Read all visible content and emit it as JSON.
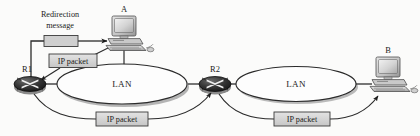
{
  "figure": {
    "kind": "network-diagram",
    "topic": "ICMP redirection",
    "background_color": "#fbfbfa",
    "ink_color": "#1b1b1b"
  },
  "hosts": [
    {
      "id": "A",
      "label": "A",
      "icon": "desktop-computer-icon"
    },
    {
      "id": "B",
      "label": "B",
      "icon": "desktop-computer-icon"
    }
  ],
  "routers": [
    {
      "id": "R1",
      "label": "R1",
      "icon": "router-icon"
    },
    {
      "id": "R2",
      "label": "R2",
      "icon": "router-icon"
    }
  ],
  "networks": [
    {
      "id": "lan-left",
      "label": "LAN",
      "shape": "ellipse"
    },
    {
      "id": "lan-right",
      "label": "LAN",
      "shape": "ellipse"
    }
  ],
  "messages": {
    "redirection": {
      "caption_line1": "Redirection",
      "caption_line2": "message",
      "box_label": "",
      "fill": "#cfcfcf"
    },
    "packets": [
      {
        "id": "ip-packet-a-to-r1",
        "label": "IP packet",
        "fill": "#d8d8d8"
      },
      {
        "id": "ip-packet-r1-to-r2",
        "label": "IP packet",
        "fill": "#d8d8d8"
      },
      {
        "id": "ip-packet-r2-to-b",
        "label": "IP packet",
        "fill": "#d8d8d8"
      }
    ]
  },
  "links": [
    {
      "id": "link-r1-lanleft",
      "from": "R1",
      "to": "lan-left",
      "style": "solid"
    },
    {
      "id": "link-lanleft-r2",
      "from": "lan-left",
      "to": "R2",
      "style": "solid"
    },
    {
      "id": "link-r2-lanright",
      "from": "R2",
      "to": "lan-right",
      "style": "solid"
    },
    {
      "id": "link-lanright-b",
      "from": "lan-right",
      "to": "B",
      "style": "solid"
    },
    {
      "id": "link-a-lanleft",
      "from": "A",
      "to": "lan-left",
      "style": "solid"
    }
  ],
  "flows": [
    {
      "id": "flow-redirect-r1-to-a",
      "from": "R1",
      "to": "A",
      "arrow": "to-host-a"
    },
    {
      "id": "flow-packet-a-to-r1",
      "from": "A",
      "to": "R1",
      "arrow": "to-router-r1"
    },
    {
      "id": "flow-packet-r1-to-r2",
      "from": "R1",
      "to": "R2",
      "arrow": "to-router-r2"
    },
    {
      "id": "flow-packet-r2-to-b",
      "from": "R2",
      "to": "B",
      "arrow": "to-host-b"
    }
  ]
}
